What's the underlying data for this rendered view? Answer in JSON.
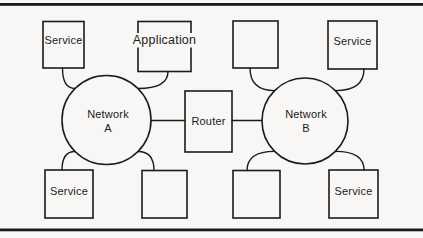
{
  "figure": {
    "background_color": "#f8f7f5",
    "ink_color": "#1b1b1b",
    "nodes": {
      "network_a": {
        "label_line1": "Network",
        "label_line2": "A"
      },
      "network_b": {
        "label_line1": "Network",
        "label_line2": "B"
      },
      "router": {
        "label": "Router"
      },
      "service_top_left": {
        "label": "Service"
      },
      "application_top": {
        "label": "Application"
      },
      "service_top_right": {
        "label": "Service"
      },
      "service_bottom_left": {
        "label": "Service"
      },
      "service_bottom_right": {
        "label": "Service"
      }
    }
  }
}
